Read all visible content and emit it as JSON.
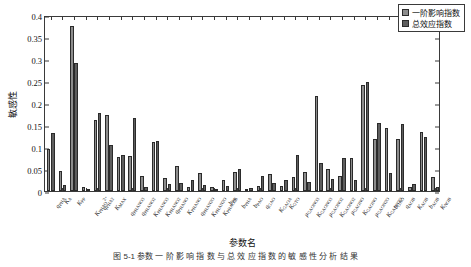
{
  "chart_data": {
    "type": "bar",
    "title": "",
    "xlabel": "参数名",
    "ylabel": "敏感性",
    "ylim": [
      0,
      0.4
    ],
    "yticks": [
      "0",
      "0.05",
      "0.1",
      "0.15",
      "0.2",
      "0.25",
      "0.3",
      "0.35",
      "0.4"
    ],
    "grid": false,
    "legend_position": "top-right",
    "legend": [
      "一阶影响指数",
      "总效应指数"
    ],
    "categories": [
      "q_PHA",
      "K_A",
      "K_PP",
      "K_PHAO2",
      "q_PHA2",
      "K_MAX",
      "q_PHANO3",
      "q_PHANO2",
      "K_PHANO3",
      "K_PHANO2",
      "q_PHANO",
      "K_PHANO",
      "q_PHAN2O",
      "K_PHAN2O",
      "K_PHAO2b",
      "b_PP",
      "b_PHA",
      "b_PAO",
      "q_GAO",
      "K_GAOA",
      "K_GTO",
      "mu_GAONO3",
      "K_GAONO3",
      "mu_GAONO2",
      "K_GAONO2",
      "mu_GAONO",
      "K_GAONO",
      "mu_GAON2O",
      "K_GAON2O",
      "b_GAO",
      "q_AOB",
      "K_AOB",
      "b_AOB",
      "K_NOB"
    ],
    "series": [
      {
        "name": "一阶影响指数",
        "values": [
          0.095,
          0.046,
          0.374,
          0.008,
          0.162,
          0.172,
          0.078,
          0.08,
          0.035,
          0.111,
          0.029,
          0.056,
          0.01,
          0.04,
          0.009,
          0.026,
          0.043,
          0.003,
          0.012,
          0.038,
          0.011,
          0.031,
          0.044,
          0.216,
          0.051,
          0.034,
          0.075,
          0.24,
          0.119,
          0.143,
          0.118,
          0.009,
          0.133,
          0.032
        ]
      },
      {
        "name": "总效应指数",
        "values": [
          0.131,
          0.014,
          0.291,
          0.004,
          0.178,
          0.105,
          0.081,
          0.167,
          0.01,
          0.113,
          0.016,
          0.019,
          0.025,
          0.013,
          0.004,
          0.012,
          0.05,
          0.007,
          0.034,
          0.018,
          0.025,
          0.081,
          0.021,
          0.063,
          0.028,
          0.074,
          0.025,
          0.247,
          0.155,
          0.041,
          0.152,
          0.015,
          0.123,
          0.01
        ]
      }
    ],
    "tick_labels_rich": [
      {
        "v": "q",
        "sub": "PHA"
      },
      {
        "v": "K",
        "sub": "A"
      },
      {
        "v": "K",
        "sub": "PP"
      },
      {
        "v": "K",
        "sub": "PHAO",
        "sup": "2+"
      },
      {
        "v": "q",
        "sub": "PHA2"
      },
      {
        "v": "K",
        "sub": "MAX"
      },
      {
        "v": "q",
        "sub": "PHANO3"
      },
      {
        "v": "q",
        "sub": "PHANO2"
      },
      {
        "v": "K",
        "sub": "PHANO3"
      },
      {
        "v": "K",
        "sub": "PHANO2"
      },
      {
        "v": "q",
        "sub": "PHANO"
      },
      {
        "v": "K",
        "sub": "PHANO"
      },
      {
        "v": "q",
        "sub": "PHAN2O"
      },
      {
        "v": "K",
        "sub": "PHAN2O"
      },
      {
        "v": "K",
        "sub": "PHAO2b"
      },
      {
        "v": "b",
        "sub": "PP"
      },
      {
        "v": "b",
        "sub": "PHA"
      },
      {
        "v": "b",
        "sub": "PAO"
      },
      {
        "v": "q",
        "sub": "GAO"
      },
      {
        "v": "K",
        "sub": "GAOA"
      },
      {
        "v": "K",
        "sub": "GTO"
      },
      {
        "v": "μ",
        "sub": "GAONO3"
      },
      {
        "v": "K",
        "sub": "GAONO3"
      },
      {
        "v": "μ",
        "sub": "GAONO2"
      },
      {
        "v": "K",
        "sub": "GAONO2"
      },
      {
        "v": "μ",
        "sub": "GAONO"
      },
      {
        "v": "K",
        "sub": "GAONO"
      },
      {
        "v": "μ",
        "sub": "GAON2O"
      },
      {
        "v": "K",
        "sub": "GAON2O"
      },
      {
        "v": "b",
        "sub": "GAO"
      },
      {
        "v": "q",
        "sub": "AOB"
      },
      {
        "v": "K",
        "sub": "AOB"
      },
      {
        "v": "b",
        "sub": "AOB"
      },
      {
        "v": "K",
        "sub": "NOB"
      }
    ]
  },
  "colors": {
    "first_order": "#8d8d8d",
    "total_effect": "#5e5e5e",
    "axis": "#3a3a3a",
    "background": "#ffffff"
  },
  "caption": {
    "text": "图 5-1   参数 一 阶 影 响 指 数 与 总 效 应 指 数 的 敏 感 性 分 析 结 果"
  }
}
